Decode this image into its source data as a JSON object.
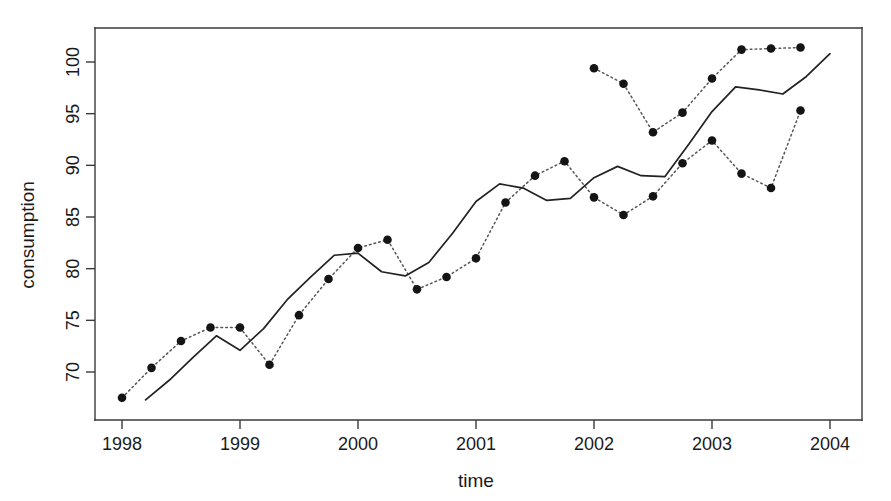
{
  "chart_data": {
    "type": "line",
    "title": "",
    "xlabel": "time",
    "ylabel": "consumption",
    "xlim": [
      1997.82,
      1998.0
    ],
    "ylim": [
      66.0,
      102.8
    ],
    "grid": false,
    "legend": "none",
    "x_ticks": [
      "1998",
      "1999",
      "2000",
      "2001",
      "2002",
      "2003",
      "2004"
    ],
    "x_tick_values": [
      1998,
      1999,
      2000,
      2001,
      2002,
      2003,
      2004
    ],
    "y_ticks": [
      "70",
      "75",
      "80",
      "85",
      "90",
      "95",
      "100"
    ],
    "y_tick_values": [
      70,
      75,
      80,
      85,
      90,
      95,
      100
    ],
    "x_axis_range": [
      1997.8,
      2004.1
    ],
    "y_axis_range": [
      66.0,
      102.8
    ],
    "series": [
      {
        "name": "observed",
        "style": "dotted-with-points",
        "marker": "filled-circle",
        "x": [
          1998.0,
          1998.25,
          1998.5,
          1998.75,
          1999.0,
          1999.25,
          1999.5,
          1999.75,
          2000.0,
          2000.25,
          2000.5,
          2000.75,
          2001.0,
          2001.25,
          2001.5,
          2001.75,
          2002.0,
          2002.25,
          2002.5,
          2002.75,
          2003.0,
          2003.25,
          2003.5,
          2003.75
        ],
        "values": [
          67.5,
          70.4,
          73.0,
          74.3,
          74.3,
          70.7,
          75.5,
          79.0,
          82.0,
          82.8,
          78.0,
          79.2,
          81.0,
          86.4,
          89.0,
          90.4,
          86.9,
          85.2,
          87.0,
          90.2,
          92.4,
          89.2,
          87.8,
          95.3
        ]
      },
      {
        "name": "observed-continued",
        "style": "dotted-with-points",
        "marker": "filled-circle",
        "x": [
          2002.0,
          2002.25,
          2002.5,
          2002.75,
          2003.0,
          2003.25,
          2003.5,
          2003.75
        ],
        "values": [
          99.4,
          97.9,
          93.2,
          95.1,
          98.4,
          101.2,
          101.3,
          101.4
        ]
      },
      {
        "name": "fitted",
        "style": "solid",
        "marker": "none",
        "x": [
          1998.2,
          1998.4,
          1998.6,
          1998.8,
          1999.0,
          1999.2,
          1999.4,
          1999.6,
          1999.8,
          2000.0,
          2000.2,
          2000.4,
          2000.6,
          2000.8,
          2001.0,
          2001.2,
          2001.4,
          2001.6,
          2001.8,
          2002.0,
          2002.2,
          2002.4,
          2002.6,
          2002.8,
          2003.0,
          2003.2,
          2003.4,
          2003.6,
          2003.8,
          2004.0
        ],
        "values": [
          67.3,
          69.2,
          71.4,
          73.5,
          72.1,
          74.2,
          77.0,
          79.2,
          81.3,
          81.5,
          79.7,
          79.3,
          80.6,
          83.4,
          86.5,
          88.2,
          87.8,
          86.6,
          86.8,
          88.8,
          89.9,
          89.0,
          88.9,
          92.0,
          95.2,
          97.6,
          97.3,
          96.9,
          98.6,
          100.8
        ]
      }
    ]
  },
  "axes": {
    "x_title": "time",
    "y_title": "consumption"
  }
}
